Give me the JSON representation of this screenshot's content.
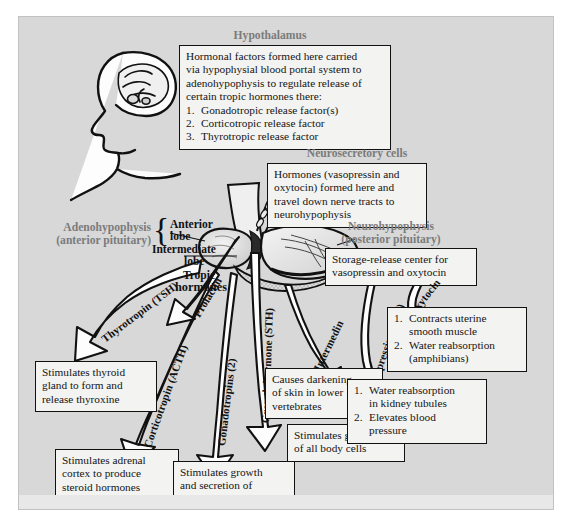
{
  "figure": {
    "background_color": "#d8d8d8",
    "box_fill": "#f3f3f1",
    "header_color": "#7b7b7b",
    "ink_color": "#111111"
  },
  "headers": {
    "hypothalamus": "Hypothalamus",
    "neurosecretory_cells": "Neurosecretory cells",
    "adenohypophysis": "Adenohypophysis",
    "adenohypophysis_sub": "(anterior pituitary)",
    "neurohypophysis": "Neurohypophysis",
    "neurohypophysis_sub": "(posterior pituitary)"
  },
  "anatomy_labels": {
    "anterior_lobe": "Anterior\nlobe",
    "anterior_lobe_l1": "Anterior",
    "anterior_lobe_l2": "lobe",
    "intermediate_lobe_l1": "Intermediate",
    "intermediate_lobe_l2": "lobe",
    "tropic_hormones_l1": "Tropic",
    "tropic_hormones_l2": "hormones"
  },
  "boxes": {
    "hypothalamus_text": {
      "lines": [
        "Hormonal factors formed here carried",
        "via hypophysial blood portal system to",
        "adenohypophysis to regulate release of",
        "certain tropic hormones there:"
      ],
      "items": [
        {
          "n": "1.",
          "t": "Gonadotropic release factor(s)"
        },
        {
          "n": "2.",
          "t": "Corticotropic release factor"
        },
        {
          "n": "3.",
          "t": "Thyrotropic release factor"
        }
      ]
    },
    "neurosecretory_text": {
      "lines": [
        "Hormones (vasopressin and",
        "oxytocin) formed here and",
        "travel down nerve tracts to",
        "neurohypophysis"
      ]
    },
    "storage_release": {
      "lines": [
        "Storage-release center for",
        "vasopressin and oxytocin"
      ]
    },
    "thyroid_effect": {
      "lines": [
        "Stimulates thyroid",
        "gland to form and",
        "release thyroxine"
      ]
    },
    "adrenal_effect": {
      "lines": [
        "Stimulates adrenal",
        "cortex to produce",
        "steroid hormones"
      ]
    },
    "gonad_effect": {
      "lines": [
        "Stimulates growth",
        "and secretion of",
        "ovaries and testis"
      ]
    },
    "melanocyte_effect": {
      "lines": [
        "Causes darkening",
        "of skin in lower",
        "vertebrates"
      ]
    },
    "growth_effect": {
      "lines": [
        "Stimulates growth",
        "of all body cells"
      ]
    },
    "oxytocin_effect": {
      "items": [
        {
          "n": "1.",
          "t1": "Contracts uterine",
          "t2": "smooth muscle"
        },
        {
          "n": "2.",
          "t1": "Water reabsorption",
          "t2": "(amphibians)"
        }
      ]
    },
    "vasopressin_effect": {
      "items": [
        {
          "n": "1.",
          "t1": "Water reabsorption",
          "t2": "in kidney tubules"
        },
        {
          "n": "2.",
          "t1": "Elevates blood",
          "t2": "pressure"
        }
      ]
    }
  },
  "arrow_labels": {
    "thyrotropin": "Thyrotropin (TSH)",
    "corticotropin": "Corticotropin (ACTH)",
    "gonadotropins": "Gonadotropins (2)",
    "prolactin": "Prolactin",
    "growth_hormone": "Growth hormone (STH)",
    "intermedin": "Intermedin",
    "vasopressin": "Vasopressin (ADH)",
    "oxytocin": "Oxytocin"
  },
  "illustrations": {
    "head": "human-head-brain-profile",
    "pituitary": "pituitary-gland-cross-section"
  }
}
